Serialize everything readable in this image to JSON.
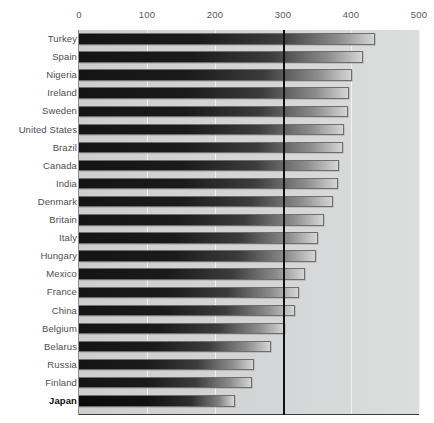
{
  "chart_data": {
    "type": "bar",
    "orientation": "horizontal",
    "title": "",
    "subtitle": "",
    "xlabel": "",
    "ylabel": "",
    "xlim": [
      0,
      500
    ],
    "ylim": null,
    "grid": true,
    "gridlines_x": [
      0,
      100,
      200,
      300,
      400,
      500
    ],
    "emphasized_gridline_x": 300,
    "legend": null,
    "legend_position": "none",
    "annotations": [],
    "highlighted_category": "Japan",
    "tick_labels_x": [
      "0",
      "100",
      "200",
      "300",
      "400",
      "500"
    ],
    "categories": [
      "Turkey",
      "Spain",
      "Nigeria",
      "Ireland",
      "Sweden",
      "United States",
      "Brazil",
      "Canada",
      "India",
      "Denmark",
      "Britain",
      "Italy",
      "Hungary",
      "Mexico",
      "France",
      "China",
      "Belgium",
      "Belarus",
      "Russia",
      "Finland",
      "Japan"
    ],
    "values": [
      435,
      417,
      402,
      397,
      396,
      389,
      388,
      382,
      381,
      374,
      360,
      351,
      348,
      332,
      323,
      318,
      303,
      283,
      257,
      255,
      229
    ],
    "bars": [
      {
        "label": "Turkey",
        "value": 435,
        "highlight": false
      },
      {
        "label": "Spain",
        "value": 417,
        "highlight": false
      },
      {
        "label": "Nigeria",
        "value": 402,
        "highlight": false
      },
      {
        "label": "Ireland",
        "value": 397,
        "highlight": false
      },
      {
        "label": "Sweden",
        "value": 396,
        "highlight": false
      },
      {
        "label": "United States",
        "value": 389,
        "highlight": false
      },
      {
        "label": "Brazil",
        "value": 388,
        "highlight": false
      },
      {
        "label": "Canada",
        "value": 382,
        "highlight": false
      },
      {
        "label": "India",
        "value": 381,
        "highlight": false
      },
      {
        "label": "Denmark",
        "value": 374,
        "highlight": false
      },
      {
        "label": "Britain",
        "value": 360,
        "highlight": false
      },
      {
        "label": "Italy",
        "value": 351,
        "highlight": false
      },
      {
        "label": "Hungary",
        "value": 348,
        "highlight": false
      },
      {
        "label": "Mexico",
        "value": 332,
        "highlight": false
      },
      {
        "label": "France",
        "value": 323,
        "highlight": false
      },
      {
        "label": "China",
        "value": 318,
        "highlight": false
      },
      {
        "label": "Belgium",
        "value": 303,
        "highlight": false
      },
      {
        "label": "Belarus",
        "value": 283,
        "highlight": false
      },
      {
        "label": "Russia",
        "value": 257,
        "highlight": false
      },
      {
        "label": "Finland",
        "value": 255,
        "highlight": false
      },
      {
        "label": "Japan",
        "value": 229,
        "highlight": true
      }
    ]
  },
  "colors": {
    "plot_background": "#d2d3d4",
    "page_background": "#ffffff",
    "bar_dark": "#141414",
    "bar_light": "#d5d5d5",
    "gridline": "#f1f1f1",
    "emphasis_line": "#111111",
    "tick_label": "#57585a",
    "category_label": "#4c4d4f",
    "highlight_label": "#0d0d0d"
  }
}
